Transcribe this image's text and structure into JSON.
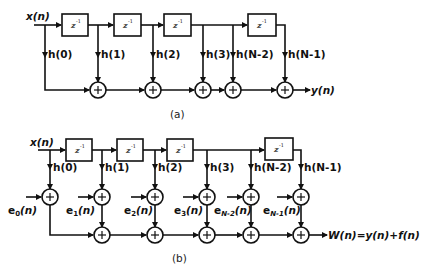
{
  "diagram": {
    "type": "FIR filter block diagram (transversal form)",
    "part_a": {
      "caption": "(a)",
      "input_label": "x(n)",
      "output_label": "y(n)",
      "delay_label": "z",
      "delay_exp": "-1",
      "taps": [
        "h(0)",
        "h(1)",
        "h(2)",
        "h(3)",
        "h(N-2)",
        "h(N-1)"
      ],
      "adder_symbol": "+"
    },
    "part_b": {
      "caption": "(b)",
      "input_label": "x(n)",
      "output_label": "W(n)=y(n)+f(n)",
      "delay_label": "z",
      "delay_exp": "-1",
      "taps": [
        "h(0)",
        "h(1)",
        "h(2)",
        "h(3)",
        "h(N-2)",
        "h(N-1)"
      ],
      "errors": [
        {
          "base": "e",
          "sub": "0",
          "tail": "(n)"
        },
        {
          "base": "e",
          "sub": "1",
          "tail": "(n)"
        },
        {
          "base": "e",
          "sub": "2",
          "tail": "(n)"
        },
        {
          "base": "e",
          "sub": "3",
          "tail": "(n)"
        },
        {
          "base": "e",
          "sub": "N-2",
          "tail": "(n)"
        },
        {
          "base": "e",
          "sub": "N-1",
          "tail": "(n)"
        }
      ],
      "adder_symbol": "+"
    }
  }
}
